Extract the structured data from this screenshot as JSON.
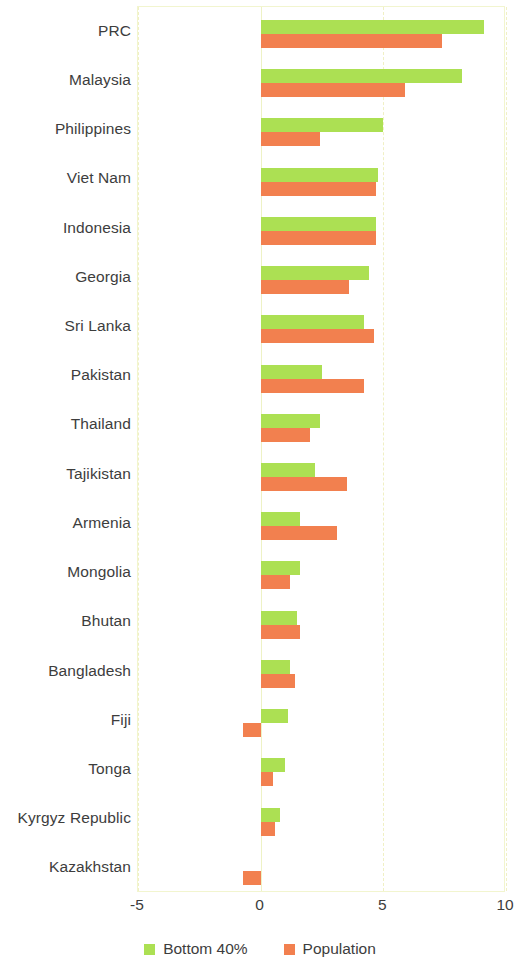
{
  "chart_data": {
    "type": "bar",
    "orientation": "horizontal",
    "title": "",
    "xlabel": "",
    "ylabel": "",
    "xlim": [
      -5,
      10
    ],
    "xticks": [
      -5,
      0,
      5,
      10
    ],
    "xtick_labels": [
      "-5",
      "0",
      "5",
      "10"
    ],
    "grid": true,
    "grid_axis": "x",
    "legend_position": "bottom",
    "categories": [
      "PRC",
      "Malaysia",
      "Philippines",
      "Viet Nam",
      "Indonesia",
      "Georgia",
      "Sri Lanka",
      "Pakistan",
      "Thailand",
      "Tajikistan",
      "Armenia",
      "Mongolia",
      "Bhutan",
      "Bangladesh",
      "Fiji",
      "Tonga",
      "Kyrgyz Republic",
      "Kazakhstan"
    ],
    "series": [
      {
        "name": "Bottom 40%",
        "color": "#ace053",
        "values": [
          9.1,
          8.2,
          5.0,
          4.8,
          4.7,
          4.4,
          4.2,
          2.5,
          2.4,
          2.2,
          1.6,
          1.6,
          1.5,
          1.2,
          1.1,
          1.0,
          0.8,
          0.0
        ]
      },
      {
        "name": "Population",
        "color": "#f2804f",
        "values": [
          7.4,
          5.9,
          2.4,
          4.7,
          4.7,
          3.6,
          4.6,
          4.2,
          2.0,
          3.5,
          3.1,
          1.2,
          1.6,
          1.4,
          -0.7,
          0.5,
          0.6,
          -0.7
        ]
      }
    ]
  },
  "legend": {
    "items": [
      {
        "label": "Bottom 40%",
        "color": "#ace053"
      },
      {
        "label": "Population",
        "color": "#f2804f"
      }
    ]
  },
  "axis": {
    "ticks": [
      "-5",
      "0",
      "5",
      "10"
    ]
  },
  "colors": {
    "green": "#ace053",
    "orange": "#f2804f",
    "frame": "#f2f5cf",
    "grid": "#f0f0c4",
    "text": "#3d3d3d"
  }
}
